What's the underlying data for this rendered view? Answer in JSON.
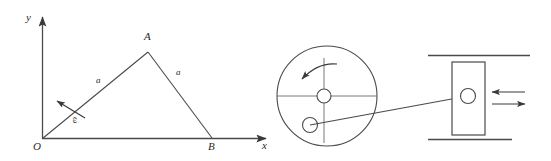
{
  "figure": {
    "background_color": "#ffffff",
    "stroke_color": "#444444",
    "label_color": "#2b2b2b",
    "width": 551,
    "height": 161
  },
  "linkage_diagram": {
    "axes": {
      "y_label": "y",
      "x_label": "x",
      "origin_label": "O"
    },
    "vertices": {
      "apex_label": "A",
      "base_label": "B",
      "origin_label": "O"
    },
    "sides": {
      "left_length_label": "a",
      "right_length_label": "a"
    },
    "angular_velocity": {
      "label": "ω",
      "direction": "counterclockwise"
    }
  },
  "crank_disk": {
    "rotation_label": "",
    "rotation_direction": "counterclockwise",
    "hub_label": "",
    "pin_label": ""
  },
  "slider": {
    "motion_arrow_left_label": "",
    "motion_arrow_right_label": "",
    "guide_label": ""
  }
}
